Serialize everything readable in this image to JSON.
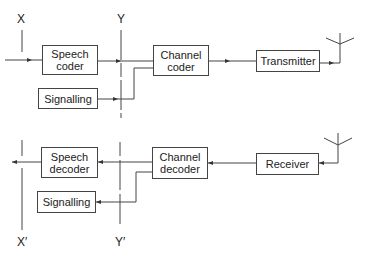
{
  "transmit_chain": {
    "input_label": "X",
    "interface_label": "Y",
    "blocks": {
      "speech_coder": "Speech coder",
      "signalling": "Signalling",
      "channel_coder": "Channel coder",
      "transmitter": "Transmitter"
    }
  },
  "receive_chain": {
    "output_label": "X′",
    "interface_label": "Y′",
    "blocks": {
      "speech_decoder": "Speech decoder",
      "signalling": "Signalling",
      "channel_decoder": "Channel decoder",
      "receiver": "Receiver"
    }
  },
  "colors": {
    "line": "#444444",
    "text": "#222222",
    "background": "#ffffff"
  }
}
